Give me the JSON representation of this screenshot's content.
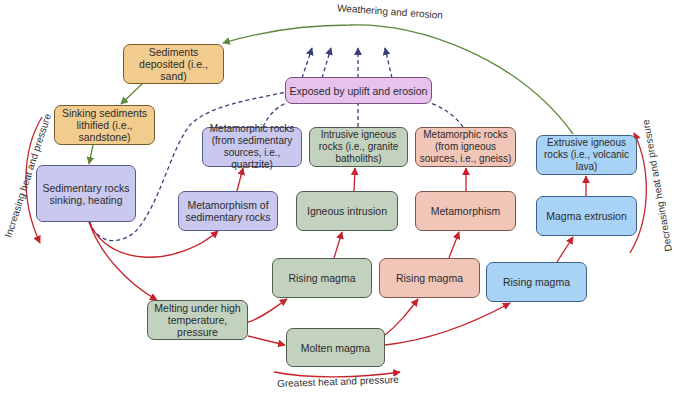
{
  "diagram": {
    "type": "rock-cycle flowchart",
    "colors": {
      "sedimentary": "#f2cc8f",
      "sedimentary_metamorphic": "#c9c8ef",
      "exposed": "#e7c2ec",
      "igneous_intrusive": "#c3d1bf",
      "igneous_metamorphic": "#f1c6b8",
      "igneous_extrusive": "#a9d3f6",
      "arrow_heat": "#c8232c",
      "arrow_weathering": "#5b8a3a",
      "arrow_uplift": "#3a3f7a"
    },
    "nodes": {
      "sediments_deposited": "Sediments deposited (i.e., sand)",
      "sinking_lithified": "Sinking sediments lithified (i.e., sandstone)",
      "sedimentary_sinking": "Sedimentary rocks sinking, heating",
      "exposed": "Exposed by uplift and erosion",
      "meta_sed_rocks": "Metamorphic rocks (from sedimentary sources, i.e., quartzite)",
      "intrusive_igneous": "Intrusive igneous rocks (i.e., granite batholiths)",
      "meta_ign_rocks": "Metamorphic rocks (from igneous sources, i.e., gneiss)",
      "extrusive_igneous": "Extrusive igneous rocks (i.e., volcanic lava)",
      "metamorphism_sed": "Metamorphism of sedimentary rocks",
      "igneous_intrusion": "Igneous intrusion",
      "metamorphism": "Metamorphism",
      "magma_extrusion": "Magma extrusion",
      "rising_magma_1": "Rising magma",
      "rising_magma_2": "Rising magma",
      "rising_magma_3": "Rising magma",
      "melting": "Melting under high temperature, pressure",
      "molten_magma": "Molten magma"
    },
    "labels": {
      "weathering": "Weathering and erosion",
      "increasing": "Increasing heat and pressure",
      "decreasing": "Decreasing heat and pressure",
      "greatest": "Greatest heat and pressure"
    }
  }
}
